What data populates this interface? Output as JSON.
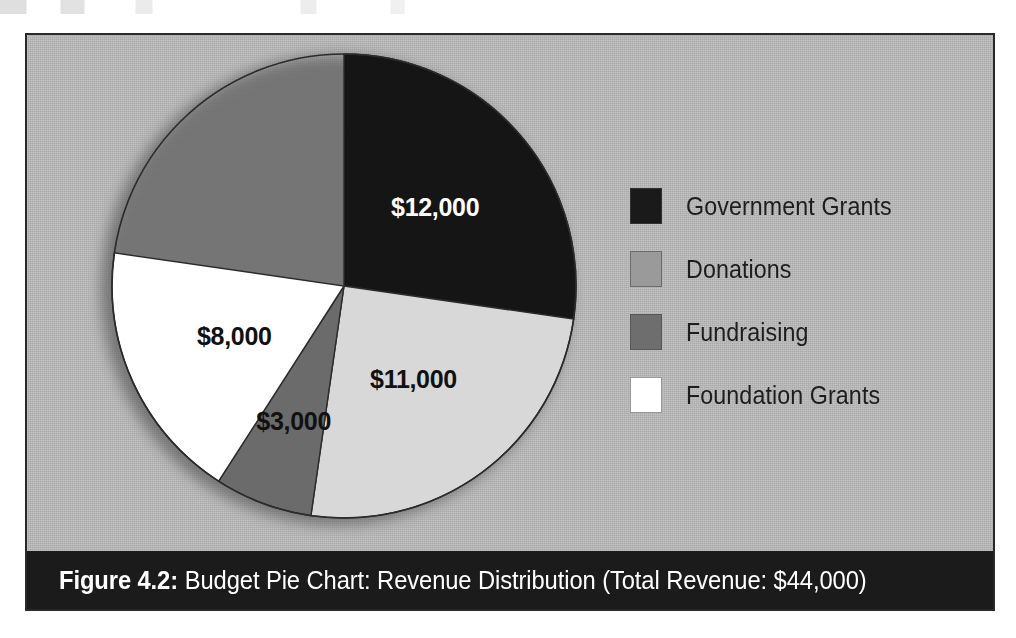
{
  "page": {
    "background_color": "#ffffff",
    "panel_background_color": "#b9b9b9",
    "panel_border_color": "#2a2a2a"
  },
  "caption": {
    "figure_number": "Figure 4.2:",
    "title": "Budget Pie Chart: Revenue Distribution (Total Revenue: $44,000)",
    "bar_color": "#1b1b1b",
    "text_color": "#ffffff"
  },
  "legend": {
    "position": "right",
    "items": [
      {
        "label": "Government Grants",
        "color": "#1a1a1a"
      },
      {
        "label": "Donations",
        "color": "#9a9a9a"
      },
      {
        "label": "Fundraising",
        "color": "#6e6e6e"
      },
      {
        "label": "Foundation Grants",
        "color": "#ffffff"
      }
    ]
  },
  "chart_data": {
    "type": "pie",
    "title": "Budget Pie Chart: Revenue Distribution",
    "subtitle": "Total Revenue: $44,000",
    "total": 44000,
    "total_label": "$44,000",
    "currency": "USD",
    "start_angle_deg": 0,
    "direction": "clockwise",
    "grid": false,
    "legend_position": "right",
    "categories": [
      "Government Grants",
      "Donations",
      "Fundraising",
      "Foundation Grants"
    ],
    "values": [
      12000,
      11000,
      3000,
      8000
    ],
    "labels": [
      "$12,000",
      "$11,000",
      "$3,000",
      "$8,000"
    ],
    "slices": [
      {
        "name": "Government Grants",
        "value": 12000,
        "label": "$12,000",
        "percent": 27.3,
        "sweep_deg": 98.2,
        "slice_color": "#151515",
        "legend_color": "#1a1a1a",
        "label_color": "light"
      },
      {
        "name": "Donations",
        "value": 11000,
        "label": "$11,000",
        "percent": 25.0,
        "sweep_deg": 90.0,
        "slice_color": "#d8d8d8",
        "legend_color": "#9a9a9a",
        "label_color": "dark"
      },
      {
        "name": "Fundraising",
        "value": 3000,
        "label": "$3,000",
        "percent": 6.8,
        "sweep_deg": 24.5,
        "slice_color": "#6b6b6b",
        "legend_color": "#6e6e6e",
        "label_color": "dark"
      },
      {
        "name": "Foundation Grants",
        "value": 8000,
        "label": "$8,000",
        "percent": 18.2,
        "sweep_deg": 65.5,
        "slice_color": "#ffffff",
        "legend_color": "#ffffff",
        "label_color": "dark"
      }
    ],
    "geometry": {
      "cx": 235,
      "cy": 235,
      "r": 232
    }
  }
}
